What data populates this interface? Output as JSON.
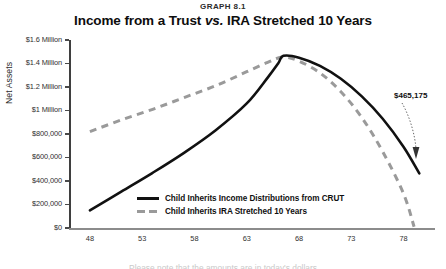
{
  "header": {
    "graph_number": "GRAPH 8.1",
    "title_before": "Income from a Trust ",
    "title_emphasis": "vs.",
    "title_after": " IRA Stretched 10 Years"
  },
  "colors": {
    "crut_line": "#111111",
    "ira_line": "#9a9a9a",
    "axis": "#3f3f3f",
    "text": "#1a1a1a",
    "annotation": "#333333"
  },
  "annotation": {
    "value_label": "$465,175"
  },
  "caption": {
    "sliver_text": "Please note that the amounts are in today's dollars"
  },
  "chart_data": {
    "type": "line",
    "title": "Income from a Trust vs. IRA Stretched 10 Years",
    "subtitle": "GRAPH 8.1",
    "xlabel": "Age of Beneficiary",
    "ylabel": "Net Assets",
    "xlim": [
      46,
      81
    ],
    "ylim": [
      0,
      1600000
    ],
    "grid": false,
    "legend_position": "inside-bottom-center",
    "xticks": [
      48,
      53,
      58,
      63,
      68,
      73,
      78
    ],
    "xticklabels": [
      "48",
      "53",
      "58",
      "63",
      "68",
      "73",
      "78"
    ],
    "yticks": [
      0,
      200000,
      400000,
      600000,
      800000,
      1000000,
      1200000,
      1400000,
      1600000
    ],
    "yticklabels": [
      "$0",
      "$200,000",
      "$400,000",
      "$600,000",
      "$800,000",
      "$1 Million",
      "$1.2 Million",
      "$1.4 Million",
      "$1.6 Million"
    ],
    "annotations": [
      {
        "text": "$465,175",
        "x": 79.5,
        "y": 465175,
        "series": "Child Inherits Income Distributions from CRUT",
        "arrow": true
      }
    ],
    "series": [
      {
        "name": "Child Inherits Income Distributions from CRUT",
        "style": "solid",
        "color": "#111111",
        "x": [
          48,
          51,
          54,
          57,
          60,
          63,
          65,
          66,
          66.5,
          68,
          70,
          72,
          74,
          76,
          78,
          79.5
        ],
        "y": [
          150000,
          310000,
          470000,
          640000,
          830000,
          1060000,
          1280000,
          1400000,
          1465000,
          1450000,
          1380000,
          1270000,
          1120000,
          930000,
          690000,
          465175
        ]
      },
      {
        "name": "Child Inherits IRA Stretched 10 Years",
        "style": "dashed",
        "color": "#9a9a9a",
        "x": [
          48,
          51,
          54,
          57,
          60,
          63,
          65,
          66.5,
          68,
          70,
          72,
          74,
          76,
          78,
          79
        ],
        "y": [
          820000,
          920000,
          1010000,
          1110000,
          1210000,
          1330000,
          1410000,
          1455000,
          1420000,
          1320000,
          1160000,
          940000,
          650000,
          290000,
          10000
        ]
      }
    ]
  }
}
